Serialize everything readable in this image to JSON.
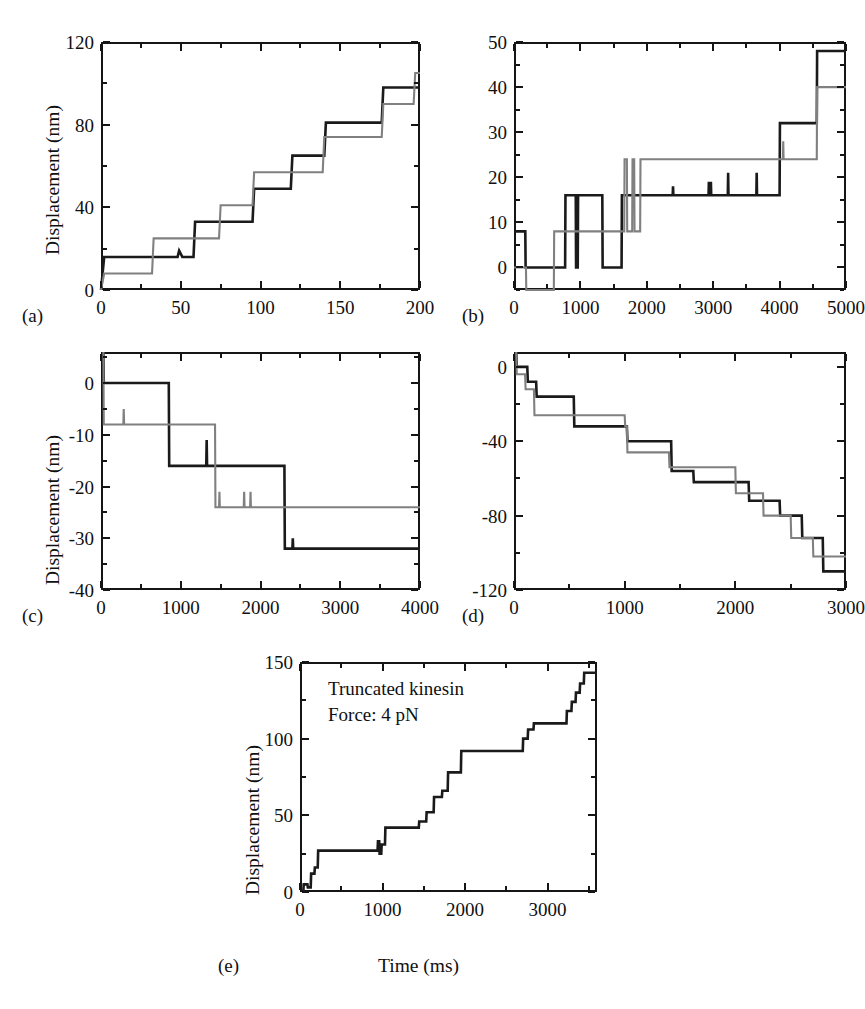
{
  "figure": {
    "caption_labels": [
      "(a)",
      "(b)",
      "(c)",
      "(d)",
      "(e)"
    ],
    "series_colors": {
      "black": "#1a1a1a",
      "gray": "#808080"
    },
    "shared_ylabel": "Displacement (nm)",
    "shared_xlabel": "Time (ms)"
  },
  "panels": {
    "a": {
      "label": "(a)",
      "ylabel": "Displacement (nm)",
      "xticks": [
        "0",
        "50",
        "100",
        "150",
        "200"
      ],
      "yticks": [
        "0",
        "40",
        "80",
        "120"
      ]
    },
    "b": {
      "label": "(b)",
      "ylabel": "",
      "xticks": [
        "0",
        "1000",
        "2000",
        "3000",
        "4000",
        "5000"
      ],
      "yticks": [
        "0",
        "10",
        "20",
        "30",
        "40",
        "50"
      ]
    },
    "c": {
      "label": "(c)",
      "ylabel": "Displacement (nm)",
      "xticks": [
        "0",
        "1000",
        "2000",
        "3000",
        "4000"
      ],
      "yticks": [
        "0",
        "-10",
        "-20",
        "-30",
        "-40"
      ]
    },
    "d": {
      "label": "(d)",
      "ylabel": "",
      "xticks": [
        "0",
        "1000",
        "2000",
        "3000"
      ],
      "yticks": [
        "0",
        "-40",
        "-80",
        "-120"
      ]
    },
    "e": {
      "label": "(e)",
      "ylabel": "Displacement (nm)",
      "xlabel": "Time (ms)",
      "xticks": [
        "0",
        "1000",
        "2000",
        "3000"
      ],
      "yticks": [
        "0",
        "50",
        "100",
        "150"
      ],
      "annotation_line1": "Truncated kinesin",
      "annotation_line2": "Force: 4 pN"
    }
  },
  "chart_data": [
    {
      "id": "a",
      "type": "line",
      "title": "",
      "xlabel": "",
      "ylabel": "Displacement (nm)",
      "xlim": [
        0,
        200
      ],
      "ylim": [
        0,
        120
      ],
      "xticks": [
        0,
        50,
        100,
        150,
        200
      ],
      "yticks": [
        0,
        40,
        80,
        120
      ],
      "grid": false,
      "legend": "none",
      "series": [
        {
          "name": "black",
          "color": "#1a1a1a",
          "style": "step",
          "points": [
            [
              0,
              0
            ],
            [
              2,
              16
            ],
            [
              48,
              16
            ],
            [
              49,
              19
            ],
            [
              51,
              16
            ],
            [
              58,
              16
            ],
            [
              59,
              33
            ],
            [
              95,
              33
            ],
            [
              96,
              49
            ],
            [
              119,
              49
            ],
            [
              120,
              65
            ],
            [
              140,
              65
            ],
            [
              141,
              81
            ],
            [
              176,
              81
            ],
            [
              177,
              98
            ],
            [
              200,
              98
            ]
          ]
        },
        {
          "name": "gray",
          "color": "#808080",
          "style": "step",
          "points": [
            [
              0,
              0
            ],
            [
              2,
              8
            ],
            [
              32,
              8
            ],
            [
              33,
              25
            ],
            [
              74,
              25
            ],
            [
              75,
              41
            ],
            [
              95,
              41
            ],
            [
              96,
              57
            ],
            [
              139,
              57
            ],
            [
              140,
              74
            ],
            [
              176,
              74
            ],
            [
              177,
              90
            ],
            [
              196,
              90
            ],
            [
              197,
              105
            ],
            [
              200,
              105
            ]
          ]
        }
      ]
    },
    {
      "id": "b",
      "type": "line",
      "title": "",
      "xlabel": "",
      "ylabel": "",
      "xlim": [
        0,
        5000
      ],
      "ylim": [
        -5,
        50
      ],
      "xticks": [
        0,
        1000,
        2000,
        3000,
        4000,
        5000
      ],
      "yticks": [
        0,
        10,
        20,
        30,
        40,
        50
      ],
      "grid": false,
      "legend": "none",
      "series": [
        {
          "name": "black",
          "color": "#1a1a1a",
          "style": "step",
          "points": [
            [
              0,
              8
            ],
            [
              170,
              8
            ],
            [
              175,
              0
            ],
            [
              770,
              0
            ],
            [
              775,
              16
            ],
            [
              930,
              16
            ],
            [
              935,
              0
            ],
            [
              960,
              0
            ],
            [
              965,
              16
            ],
            [
              1330,
              16
            ],
            [
              1335,
              0
            ],
            [
              1620,
              0
            ],
            [
              1625,
              16
            ],
            [
              2390,
              16
            ],
            [
              2395,
              18
            ],
            [
              2400,
              16
            ],
            [
              2930,
              16
            ],
            [
              2935,
              19
            ],
            [
              2940,
              16
            ],
            [
              2960,
              16
            ],
            [
              2965,
              19
            ],
            [
              2970,
              16
            ],
            [
              3220,
              16
            ],
            [
              3225,
              21
            ],
            [
              3230,
              16
            ],
            [
              3650,
              16
            ],
            [
              3655,
              21
            ],
            [
              3660,
              16
            ],
            [
              4000,
              16
            ],
            [
              4005,
              32
            ],
            [
              4560,
              32
            ],
            [
              4565,
              48
            ],
            [
              5000,
              48
            ]
          ]
        },
        {
          "name": "gray",
          "color": "#808080",
          "style": "step",
          "points": [
            [
              0,
              0
            ],
            [
              180,
              0
            ],
            [
              185,
              -5
            ],
            [
              600,
              -5
            ],
            [
              605,
              8
            ],
            [
              1660,
              8
            ],
            [
              1665,
              24
            ],
            [
              1700,
              24
            ],
            [
              1705,
              8
            ],
            [
              1780,
              8
            ],
            [
              1785,
              24
            ],
            [
              1810,
              24
            ],
            [
              1815,
              8
            ],
            [
              1900,
              8
            ],
            [
              1905,
              24
            ],
            [
              4050,
              24
            ],
            [
              4055,
              28
            ],
            [
              4060,
              24
            ],
            [
              4560,
              24
            ],
            [
              4565,
              40
            ],
            [
              5000,
              40
            ]
          ]
        }
      ]
    },
    {
      "id": "c",
      "type": "line",
      "title": "",
      "xlabel": "",
      "ylabel": "Displacement (nm)",
      "xlim": [
        0,
        4000
      ],
      "ylim": [
        -40,
        6
      ],
      "xticks": [
        0,
        1000,
        2000,
        3000,
        4000
      ],
      "yticks": [
        0,
        -10,
        -20,
        -30,
        -40
      ],
      "grid": false,
      "legend": "none",
      "series": [
        {
          "name": "black",
          "color": "#1a1a1a",
          "style": "step",
          "points": [
            [
              30,
              6
            ],
            [
              35,
              0
            ],
            [
              850,
              0
            ],
            [
              855,
              -16
            ],
            [
              1320,
              -16
            ],
            [
              1325,
              -11
            ],
            [
              1330,
              -16
            ],
            [
              2300,
              -16
            ],
            [
              2305,
              -32
            ],
            [
              2400,
              -32
            ],
            [
              2405,
              -30
            ],
            [
              2410,
              -32
            ],
            [
              4000,
              -32
            ]
          ]
        },
        {
          "name": "gray",
          "color": "#808080",
          "style": "step",
          "points": [
            [
              30,
              6
            ],
            [
              35,
              -8
            ],
            [
              280,
              -8
            ],
            [
              285,
              -5
            ],
            [
              290,
              -8
            ],
            [
              1430,
              -8
            ],
            [
              1435,
              -24
            ],
            [
              1480,
              -24
            ],
            [
              1485,
              -21
            ],
            [
              1490,
              -24
            ],
            [
              1790,
              -24
            ],
            [
              1795,
              -21
            ],
            [
              1800,
              -24
            ],
            [
              1870,
              -24
            ],
            [
              1875,
              -21
            ],
            [
              1880,
              -24
            ],
            [
              4000,
              -24
            ]
          ]
        }
      ]
    },
    {
      "id": "d",
      "type": "line",
      "title": "",
      "xlabel": "",
      "ylabel": "",
      "xlim": [
        0,
        3000
      ],
      "ylim": [
        -120,
        8
      ],
      "xticks": [
        0,
        1000,
        2000,
        3000
      ],
      "yticks": [
        0,
        -40,
        -80,
        -120
      ],
      "grid": false,
      "legend": "none",
      "series": [
        {
          "name": "black",
          "color": "#1a1a1a",
          "style": "step",
          "points": [
            [
              20,
              8
            ],
            [
              25,
              0
            ],
            [
              120,
              0
            ],
            [
              125,
              -8
            ],
            [
              200,
              -8
            ],
            [
              205,
              -16
            ],
            [
              540,
              -16
            ],
            [
              545,
              -32
            ],
            [
              1020,
              -32
            ],
            [
              1025,
              -40
            ],
            [
              1420,
              -40
            ],
            [
              1425,
              -56
            ],
            [
              1620,
              -56
            ],
            [
              1625,
              -62
            ],
            [
              2120,
              -62
            ],
            [
              2125,
              -72
            ],
            [
              2400,
              -72
            ],
            [
              2405,
              -80
            ],
            [
              2600,
              -80
            ],
            [
              2605,
              -92
            ],
            [
              2790,
              -92
            ],
            [
              2795,
              -110
            ],
            [
              3000,
              -110
            ]
          ]
        },
        {
          "name": "gray",
          "color": "#808080",
          "style": "step",
          "points": [
            [
              20,
              8
            ],
            [
              25,
              -4
            ],
            [
              100,
              -4
            ],
            [
              105,
              -12
            ],
            [
              180,
              -12
            ],
            [
              185,
              -26
            ],
            [
              1000,
              -26
            ],
            [
              1005,
              -32
            ],
            [
              1020,
              -32
            ],
            [
              1025,
              -46
            ],
            [
              1400,
              -46
            ],
            [
              1405,
              -54
            ],
            [
              2000,
              -54
            ],
            [
              2005,
              -68
            ],
            [
              2250,
              -68
            ],
            [
              2255,
              -80
            ],
            [
              2500,
              -80
            ],
            [
              2505,
              -92
            ],
            [
              2700,
              -92
            ],
            [
              2705,
              -102
            ],
            [
              3000,
              -102
            ]
          ]
        }
      ]
    },
    {
      "id": "e",
      "type": "line",
      "title": "Truncated kinesin; Force: 4 pN",
      "xlabel": "Time (ms)",
      "ylabel": "Displacement (nm)",
      "xlim": [
        0,
        3600
      ],
      "ylim": [
        0,
        150
      ],
      "xticks": [
        0,
        1000,
        2000,
        3000
      ],
      "yticks": [
        0,
        50,
        100,
        150
      ],
      "grid": false,
      "legend": "none",
      "series": [
        {
          "name": "black",
          "color": "#1a1a1a",
          "style": "step",
          "points": [
            [
              40,
              0
            ],
            [
              45,
              5
            ],
            [
              90,
              5
            ],
            [
              95,
              3
            ],
            [
              130,
              3
            ],
            [
              135,
              12
            ],
            [
              175,
              12
            ],
            [
              180,
              16
            ],
            [
              215,
              16
            ],
            [
              220,
              27
            ],
            [
              940,
              27
            ],
            [
              945,
              33
            ],
            [
              960,
              33
            ],
            [
              965,
              25
            ],
            [
              985,
              25
            ],
            [
              990,
              31
            ],
            [
              1030,
              31
            ],
            [
              1035,
              42
            ],
            [
              1440,
              42
            ],
            [
              1445,
              46
            ],
            [
              1530,
              46
            ],
            [
              1535,
              52
            ],
            [
              1620,
              52
            ],
            [
              1625,
              62
            ],
            [
              1720,
              62
            ],
            [
              1725,
              66
            ],
            [
              1790,
              66
            ],
            [
              1795,
              78
            ],
            [
              1950,
              78
            ],
            [
              1955,
              92
            ],
            [
              2700,
              92
            ],
            [
              2705,
              100
            ],
            [
              2760,
              100
            ],
            [
              2765,
              106
            ],
            [
              2830,
              106
            ],
            [
              2835,
              110
            ],
            [
              3230,
              110
            ],
            [
              3235,
              118
            ],
            [
              3290,
              118
            ],
            [
              3295,
              124
            ],
            [
              3340,
              124
            ],
            [
              3345,
              130
            ],
            [
              3390,
              130
            ],
            [
              3395,
              136
            ],
            [
              3440,
              136
            ],
            [
              3445,
              143
            ],
            [
              3600,
              143
            ]
          ]
        }
      ]
    }
  ]
}
